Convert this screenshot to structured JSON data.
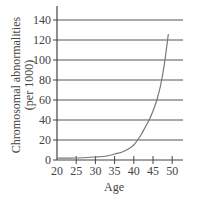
{
  "chart_data": {
    "type": "line",
    "title": "",
    "xlabel": "Age",
    "ylabel_line1": "Chromosomal abnormalities",
    "ylabel_line2": "(per 1000)",
    "ylabel": "Chromosomal abnormalities (per 1000)",
    "xlim": [
      20,
      52
    ],
    "ylim": [
      0,
      150
    ],
    "x_ticks": [
      20,
      25,
      30,
      35,
      40,
      45,
      50
    ],
    "y_ticks": [
      0,
      20,
      40,
      60,
      80,
      100,
      120,
      140
    ],
    "grid": "horizontal",
    "legend": null,
    "series": [
      {
        "name": "Chromosomal abnormalities",
        "x": [
          20,
          25,
          30,
          33,
          35,
          37,
          39,
          40,
          41,
          42,
          43,
          44,
          45,
          46,
          47,
          48,
          49
        ],
        "values": [
          2,
          2,
          3,
          4,
          6,
          8,
          12,
          15,
          20,
          26,
          33,
          40,
          49,
          60,
          75,
          97,
          126
        ]
      }
    ]
  },
  "axis": {
    "x_tick_labels": [
      "20",
      "25",
      "30",
      "35",
      "40",
      "45",
      "50"
    ],
    "y_tick_labels": [
      "0",
      "20",
      "40",
      "60",
      "80",
      "100",
      "120",
      "140"
    ],
    "x_title": "Age",
    "y_title_line1": "Chromosomal abnormalities",
    "y_title_line2": "(per 1000)"
  },
  "colors": {
    "grid": "#555555",
    "axis": "#444444",
    "curve": "#777777",
    "text": "#444444"
  }
}
